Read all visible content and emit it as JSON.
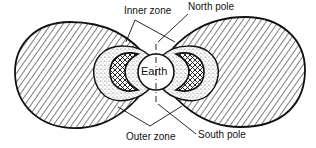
{
  "diagram": {
    "labels": {
      "inner_zone": "Inner zone",
      "north_pole": "North pole",
      "earth": "Earth",
      "outer_zone": "Outer zone",
      "south_pole": "South pole"
    },
    "colors": {
      "ink": "#111111",
      "background": "#ffffff"
    },
    "patterns": {
      "magnetosphere": "diagonal-hatch",
      "outer_zone": "stipple",
      "inner_zone": "crosshatch"
    }
  }
}
